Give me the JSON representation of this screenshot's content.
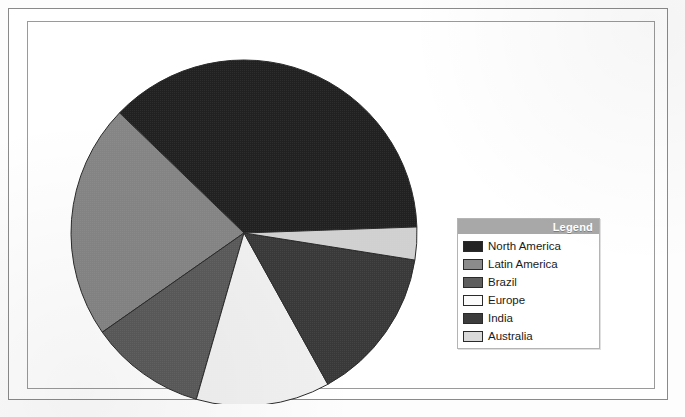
{
  "chart_data": {
    "type": "pie",
    "title": "",
    "subtitle": "",
    "xlabel": "",
    "ylabel": "",
    "grid": false,
    "legend_position": "right",
    "legend_title": "Legend",
    "center": {
      "x": 180,
      "y": 181
    },
    "radius": 173,
    "start_angle_deg": -2,
    "direction": "clockwise",
    "categories": [
      "North America",
      "Latin America",
      "Brazil",
      "Europe",
      "India",
      "Australia"
    ],
    "values": [
      37,
      22,
      11,
      12.5,
      14.5,
      3
    ],
    "slices": [
      {
        "label": "North America",
        "value": 37,
        "angle_deg": 134,
        "start_deg": 224,
        "end_deg": 358,
        "color": "#232323"
      },
      {
        "label": "Latin America",
        "value": 22,
        "angle_deg": 79,
        "start_deg": 145,
        "end_deg": 224,
        "color": "#8b8b8b"
      },
      {
        "label": "Brazil",
        "value": 11,
        "angle_deg": 39,
        "start_deg": 106,
        "end_deg": 145,
        "color": "#5e5e5e"
      },
      {
        "label": "Europe",
        "value": 12.5,
        "angle_deg": 45,
        "start_deg": 61,
        "end_deg": 106,
        "color": "#fbfbfb"
      },
      {
        "label": "India",
        "value": 14.5,
        "angle_deg": 52,
        "start_deg": 9,
        "end_deg": 61,
        "color": "#3c3c3c"
      },
      {
        "label": "Australia",
        "value": 3,
        "angle_deg": 11,
        "start_deg": 358,
        "end_deg": 9,
        "color": "#d9d9d9"
      }
    ],
    "colors": {
      "north_america": "#232323",
      "latin_america": "#8b8b8b",
      "brazil": "#5e5e5e",
      "europe": "#fbfbfb",
      "india": "#3c3c3c",
      "australia": "#d9d9d9",
      "slice_outline": "#2b2b2b",
      "legend_title_bg": "#a8a8a8",
      "legend_title_text": "#ffffff",
      "legend_border": "#b4b4b4",
      "frame_border": "#8a8a8a",
      "background": "#ffffff"
    }
  },
  "legend": {
    "title": "Legend",
    "items": [
      {
        "label": "North America",
        "color": "#232323"
      },
      {
        "label": "Latin America",
        "color": "#8b8b8b"
      },
      {
        "label": "Brazil",
        "color": "#5e5e5e"
      },
      {
        "label": "Europe",
        "color": "#fbfbfb"
      },
      {
        "label": "India",
        "color": "#3c3c3c"
      },
      {
        "label": "Australia",
        "color": "#d9d9d9"
      }
    ]
  }
}
